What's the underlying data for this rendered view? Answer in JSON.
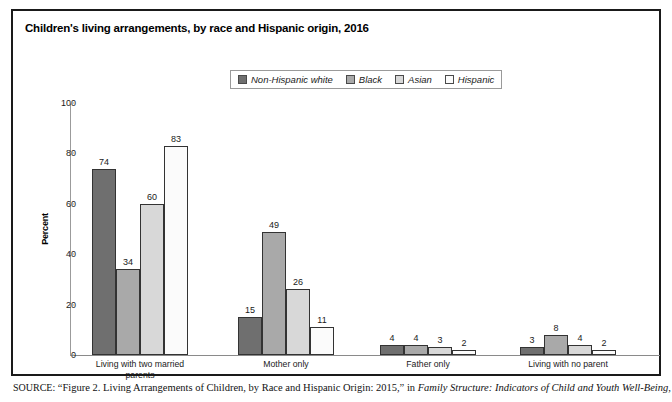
{
  "figure": {
    "title": "Children's living arrangements, by race and Hispanic origin, 2016",
    "source_keyword": "SOURCE:",
    "source_text": " “Figure 2. Living Arrangements of Children, by Race and Hispanic Origin: 2015,” in ",
    "source_italic": "Family Structure: Indicators of Child and Youth Well-Being,"
  },
  "chart_data": {
    "type": "bar",
    "title": "Children's living arrangements, by race and Hispanic origin, 2016",
    "xlabel": "",
    "ylabel": "Percent",
    "ylim": [
      0,
      100
    ],
    "yticks": [
      0,
      20,
      40,
      60,
      80,
      100
    ],
    "grid": false,
    "legend_position": "top-center",
    "categories": [
      "Living with two married\nparents",
      "Mother only",
      "Father only",
      "Living with no parent"
    ],
    "series": [
      {
        "name": "Non-Hispanic white",
        "color": "#6f6f6f",
        "values": [
          74,
          15,
          4,
          3
        ]
      },
      {
        "name": "Black",
        "color": "#a9a9a9",
        "values": [
          34,
          49,
          4,
          8
        ]
      },
      {
        "name": "Asian",
        "color": "#d8d8d8",
        "values": [
          60,
          26,
          3,
          4
        ]
      },
      {
        "name": "Hispanic",
        "color": "#fbfbfb",
        "values": [
          83,
          11,
          2,
          2
        ]
      }
    ]
  }
}
